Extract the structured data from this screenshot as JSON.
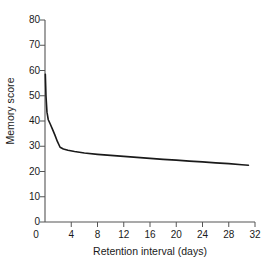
{
  "chart_data": {
    "type": "line",
    "title": "",
    "xlabel": "Retention interval (days)",
    "ylabel": "Memory score",
    "xlim": [
      0,
      32
    ],
    "ylim": [
      0,
      80
    ],
    "xticks": [
      0,
      4,
      8,
      12,
      16,
      20,
      24,
      28,
      32
    ],
    "yticks": [
      0,
      10,
      20,
      30,
      40,
      50,
      60,
      70,
      80
    ],
    "xtick_labels": [
      "0",
      "4",
      "8",
      "12",
      "16",
      "20",
      "24",
      "28",
      "32"
    ],
    "ytick_labels": [
      "0",
      "10",
      "20",
      "30",
      "40",
      "50",
      "60",
      "70",
      "80"
    ],
    "grid": false,
    "legend": false,
    "line_color": "#1a1a1a",
    "line_width": 1.6,
    "series": [
      {
        "name": "Memory score",
        "x": [
          0.05,
          0.15,
          0.3,
          0.5,
          0.8,
          1.1,
          1.5,
          1.9,
          2.3,
          2.8,
          3.5,
          4.5,
          6.0,
          8.0,
          10.0,
          12.0,
          14.0,
          16.0,
          18.0,
          20.0,
          22.0,
          24.0,
          26.0,
          28.0,
          30.0,
          31.0
        ],
        "y": [
          58.5,
          50.0,
          43.5,
          40.5,
          38.8,
          37.0,
          34.5,
          31.8,
          29.6,
          28.9,
          28.4,
          27.9,
          27.3,
          26.8,
          26.4,
          26.0,
          25.6,
          25.2,
          24.8,
          24.5,
          24.1,
          23.8,
          23.4,
          23.1,
          22.7,
          22.5
        ]
      }
    ]
  },
  "axes": {
    "tick_color": "#555555",
    "axis_color": "#555555"
  }
}
